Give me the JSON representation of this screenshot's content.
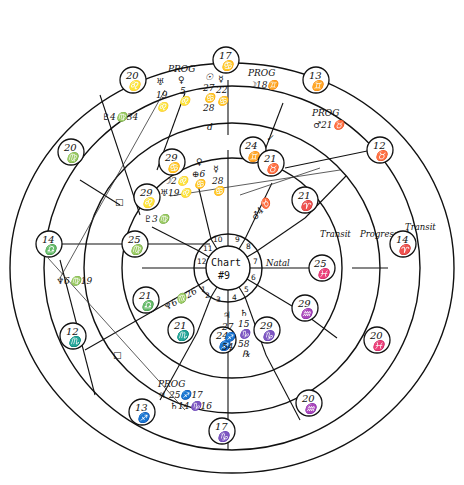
{
  "chart": {
    "title": "Chart",
    "number": "#9",
    "ring_labels": {
      "natal": "Natal",
      "transit_inner": "Transit",
      "progressed": "Progressed",
      "transit_outer": "Transit"
    }
  },
  "houses": [
    "1",
    "2",
    "3",
    "4",
    "5",
    "6",
    "7",
    "8",
    "9",
    "10",
    "11",
    "12"
  ],
  "natal_cusps": [
    {
      "deg": "24",
      "sign": "♊",
      "name": "natal-cusp-10"
    },
    {
      "deg": "21",
      "sign": "♉",
      "name": "natal-cusp-9"
    },
    {
      "deg": "21",
      "sign": "♈",
      "name": "natal-cusp-8"
    },
    {
      "deg": "25",
      "sign": "♓",
      "name": "natal-cusp-7"
    },
    {
      "deg": "29",
      "sign": "♒",
      "name": "natal-cusp-6"
    },
    {
      "deg": "29",
      "sign": "♑",
      "name": "natal-cusp-5"
    },
    {
      "deg": "24",
      "sign": "♐",
      "name": "natal-cusp-4"
    },
    {
      "deg": "21",
      "sign": "♏",
      "name": "natal-cusp-3"
    },
    {
      "deg": "21",
      "sign": "♎",
      "name": "natal-cusp-2"
    },
    {
      "deg": "25",
      "sign": "♍",
      "name": "natal-cusp-1"
    },
    {
      "deg": "29",
      "sign": "♌",
      "name": "natal-cusp-12"
    },
    {
      "deg": "29",
      "sign": "♋",
      "name": "natal-cusp-11"
    }
  ],
  "outer_cusps": [
    {
      "deg": "17",
      "sign": "♋",
      "name": "outer-cusp-top"
    },
    {
      "deg": "13",
      "sign": "♊",
      "name": "outer-cusp-upper-right"
    },
    {
      "deg": "12",
      "sign": "♉",
      "name": "outer-cusp-right-upper"
    },
    {
      "deg": "14",
      "sign": "♈",
      "name": "outer-cusp-right"
    },
    {
      "deg": "20",
      "sign": "♓",
      "name": "outer-cusp-right-lower"
    },
    {
      "deg": "20",
      "sign": "♒",
      "name": "outer-cusp-lower-right"
    },
    {
      "deg": "17",
      "sign": "♑",
      "name": "outer-cusp-bottom"
    },
    {
      "deg": "13",
      "sign": "♐",
      "name": "outer-cusp-lower-left"
    },
    {
      "deg": "12",
      "sign": "♏",
      "name": "outer-cusp-left-lower"
    },
    {
      "deg": "14",
      "sign": "♎",
      "name": "outer-cusp-left"
    },
    {
      "deg": "20",
      "sign": "♍",
      "name": "outer-cusp-left-upper"
    },
    {
      "deg": "20",
      "sign": "♌",
      "name": "outer-cusp-upper-left"
    }
  ],
  "annotations": {
    "prog_top_left": "PROG",
    "prog_venus": "♀",
    "prog_venus_deg": "5",
    "prog_venus_sign": "♌",
    "uranus": "♅",
    "uranus_deg": "19",
    "uranus_sign": "♌",
    "pluto_moon": "♇4♍34",
    "sun": "☉",
    "sun_deg": "27",
    "sun_sign": "♋",
    "sun_min": "28",
    "mercury": "☿",
    "mercury_deg": "22",
    "mercury_sign": "♋",
    "prog_moon_label": "PROG",
    "prog_moon": "☽18♊",
    "prog_mars_label": "PROG",
    "prog_mars": "♂21♉",
    "natal_mars": "♂4♉",
    "venus_natal": "♀",
    "venus_natal_val": "⊕6",
    "venus_natal_sign": "♋",
    "mercury_natal": "☿",
    "mercury_natal_deg": "28",
    "mercury_natal_sign": "♋",
    "moon_natal": "☽2♌",
    "uranus_natal": "♅19♌",
    "asc_note": "♇3♍",
    "neptune_note": "♆6♍19",
    "saturn_natal_note": "♆6♍26",
    "jupiter": "♃",
    "jupiter_deg": "27",
    "jupiter_sign": "♐",
    "jupiter_min": "54",
    "saturn": "♄",
    "saturn_deg": "15",
    "saturn_sign": "♑",
    "saturn_min": "58",
    "saturn_r": "℞",
    "prog_bottom_label": "PROG",
    "prog_jupiter": "♃ 25♐17",
    "prog_saturn": "♄14♑16",
    "check_mark": "✓",
    "square_mark": "□",
    "small_d": "d"
  }
}
